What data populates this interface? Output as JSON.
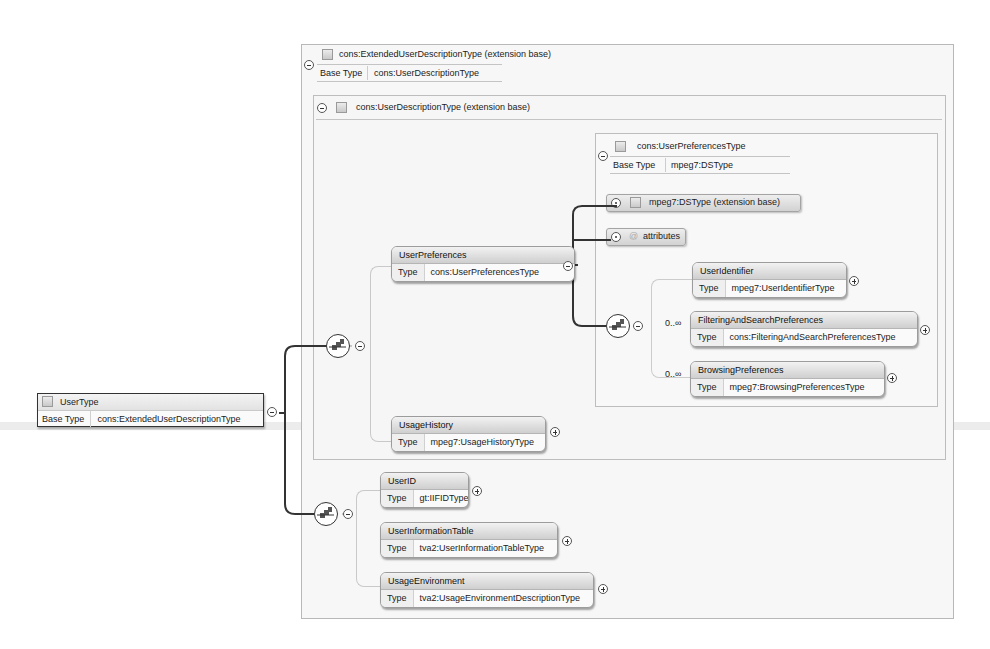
{
  "diagram": {
    "root": {
      "name": "UserType",
      "base_type_label": "Base Type",
      "base_type": "cons:ExtendedUserDescriptionType"
    },
    "extended_type": {
      "title": "cons:ExtendedUserDescriptionType (extension base)",
      "base_type_label": "Base Type",
      "base_type": "cons:UserDescriptionType"
    },
    "user_description_type": {
      "title": "cons:UserDescriptionType (extension base)"
    },
    "user_preferences_type": {
      "title": "cons:UserPreferencesType",
      "base_type_label": "Base Type",
      "base_type": "mpeg7:DSType",
      "extension_ribbon": "mpeg7:DSType (extension base)",
      "attributes_label": "attributes",
      "attributes_glyph": "@"
    },
    "elements": {
      "user_preferences": {
        "name": "UserPreferences",
        "type_label": "Type",
        "type": "cons:UserPreferencesType"
      },
      "usage_history": {
        "name": "UsageHistory",
        "type_label": "Type",
        "type": "mpeg7:UsageHistoryType"
      },
      "user_identifier": {
        "name": "UserIdentifier",
        "type_label": "Type",
        "type": "mpeg7:UserIdentifierType"
      },
      "filtering": {
        "name": "FilteringAndSearchPreferences",
        "type_label": "Type",
        "type": "cons:FilteringAndSearchPreferencesType",
        "multiplicity": "0..∞"
      },
      "browsing": {
        "name": "BrowsingPreferences",
        "type_label": "Type",
        "type": "mpeg7:BrowsingPreferencesType",
        "multiplicity": "0..∞"
      },
      "user_id": {
        "name": "UserID",
        "type_label": "Type",
        "type": "gt:IIFIDType"
      },
      "user_information_table": {
        "name": "UserInformationTable",
        "type_label": "Type",
        "type": "tva2:UserInformationTableType"
      },
      "usage_environment": {
        "name": "UsageEnvironment",
        "type_label": "Type",
        "type": "tva2:UsageEnvironmentDescriptionType"
      }
    },
    "colors": {
      "line": "#333333",
      "frame_border": "#b8b8b8",
      "header_gradient_top": "#f2f2f2",
      "header_gradient_bottom": "#cfcfcf"
    }
  }
}
